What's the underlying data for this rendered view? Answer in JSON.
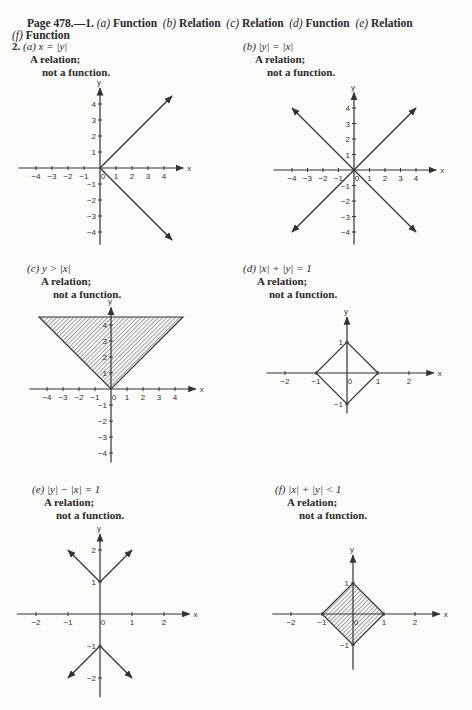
{
  "header": {
    "page_ref": "Page 478.—1.",
    "answers_line1": [
      {
        "part": "(a)",
        "answer": "Function"
      },
      {
        "part": "(b)",
        "answer": "Relation"
      },
      {
        "part": "(c)",
        "answer": "Relation"
      },
      {
        "part": "(d)",
        "answer": "Function"
      },
      {
        "part": "(e)",
        "answer": "Relation"
      }
    ],
    "answers_line2": [
      {
        "part": "(f)",
        "answer": "Function"
      }
    ],
    "problem2_number": "2."
  },
  "graphs": [
    {
      "part": "(a)",
      "equation": "x = |y|",
      "line1": "A relation;",
      "line2": "not a function."
    },
    {
      "part": "(b)",
      "equation": "|y| = |x|",
      "line1": "A relation;",
      "line2": "not a function."
    },
    {
      "part": "(c)",
      "equation": "y > |x|",
      "line1": "A relation;",
      "line2": "not a function."
    },
    {
      "part": "(d)",
      "equation": "|x| + |y| = 1",
      "line1": "A relation;",
      "line2": "not a function."
    },
    {
      "part": "(e)",
      "equation": "|y| − |x| = 1",
      "line1": "A relation;",
      "line2": "not a function."
    },
    {
      "part": "(f)",
      "equation": "|x| + |y| < 1",
      "line1": "A relation;",
      "line2": "not a function."
    }
  ],
  "axis_labels": {
    "x": "x",
    "y": "y"
  },
  "chart_data": [
    {
      "type": "line",
      "title": "(a) x = |y|",
      "xlim": [
        -4.5,
        4.5
      ],
      "ylim": [
        -4.5,
        4.5
      ],
      "xticks": [
        -4,
        -3,
        -2,
        -1,
        0,
        1,
        2,
        3,
        4
      ],
      "yticks": [
        -4,
        -3,
        -2,
        -1,
        1,
        2,
        3,
        4
      ],
      "series": [
        {
          "name": "y = x (x≥0)",
          "points": [
            [
              0,
              0
            ],
            [
              4.5,
              4.5
            ]
          ]
        },
        {
          "name": "y = -x (x≥0)",
          "points": [
            [
              0,
              0
            ],
            [
              4.5,
              -4.5
            ]
          ]
        }
      ]
    },
    {
      "type": "line",
      "title": "(b) |y| = |x|",
      "xlim": [
        -4.5,
        4.5
      ],
      "ylim": [
        -4.5,
        4.5
      ],
      "xticks": [
        -4,
        -3,
        -2,
        -1,
        0,
        1,
        2,
        3,
        4
      ],
      "yticks": [
        -4,
        -3,
        -2,
        -1,
        1,
        2,
        3,
        4
      ],
      "series": [
        {
          "name": "y = x",
          "points": [
            [
              -4,
              -4
            ],
            [
              4,
              4
            ]
          ]
        },
        {
          "name": "y = -x",
          "points": [
            [
              -4,
              4
            ],
            [
              4,
              -4
            ]
          ]
        }
      ]
    },
    {
      "type": "area",
      "title": "(c) y > |x|",
      "xlim": [
        -4.5,
        4.5
      ],
      "ylim": [
        -4.5,
        4.5
      ],
      "xticks": [
        -4,
        -3,
        -2,
        -1,
        0,
        1,
        2,
        3,
        4
      ],
      "yticks": [
        -4,
        -3,
        -2,
        -1,
        1,
        2,
        3,
        4
      ],
      "shaded_region": "above y = |x|",
      "boundary": [
        [
          -4.5,
          4.5
        ],
        [
          0,
          0
        ],
        [
          4.5,
          4.5
        ]
      ]
    },
    {
      "type": "line",
      "title": "(d) |x| + |y| = 1",
      "xlim": [
        -2.5,
        2.5
      ],
      "ylim": [
        -1.2,
        1.5
      ],
      "xticks": [
        -2,
        -1,
        0,
        1,
        2
      ],
      "yticks": [
        -1,
        1
      ],
      "series": [
        {
          "name": "diamond",
          "points": [
            [
              1,
              0
            ],
            [
              0,
              1
            ],
            [
              -1,
              0
            ],
            [
              0,
              -1
            ],
            [
              1,
              0
            ]
          ]
        }
      ]
    },
    {
      "type": "line",
      "title": "(e) |y| − |x| = 1",
      "xlim": [
        -2.5,
        2.5
      ],
      "ylim": [
        -2.5,
        2.5
      ],
      "xticks": [
        -2,
        -1,
        0,
        1,
        2
      ],
      "yticks": [
        -2,
        -1,
        1,
        2
      ],
      "series": [
        {
          "name": "upper",
          "points": [
            [
              -1,
              2
            ],
            [
              0,
              1
            ],
            [
              1,
              2
            ]
          ]
        },
        {
          "name": "lower",
          "points": [
            [
              -1,
              -2
            ],
            [
              0,
              -1
            ],
            [
              1,
              -2
            ]
          ]
        }
      ]
    },
    {
      "type": "area",
      "title": "(f) |x| + |y| < 1",
      "xlim": [
        -2.5,
        2.5
      ],
      "ylim": [
        -1.5,
        1.5
      ],
      "xticks": [
        -2,
        -1,
        0,
        1,
        2
      ],
      "yticks": [
        -1,
        1
      ],
      "shaded_region": "inside diamond",
      "boundary": [
        [
          1,
          0
        ],
        [
          0,
          1
        ],
        [
          -1,
          0
        ],
        [
          0,
          -1
        ],
        [
          1,
          0
        ]
      ]
    }
  ]
}
